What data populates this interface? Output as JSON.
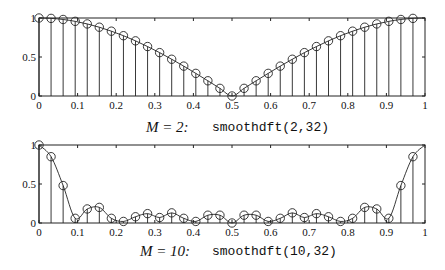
{
  "chart_data": [
    {
      "type": "stem",
      "title": "",
      "caption_math": "M = 2:",
      "caption_code": "smoothdft(2,32)",
      "xlabel": "",
      "ylabel": "",
      "xlim": [
        0,
        1
      ],
      "ylim": [
        0,
        1
      ],
      "xticks": [
        "0",
        "0.1",
        "0.2",
        "0.3",
        "0.4",
        "0.5",
        "0.6",
        "0.7",
        "0.8",
        "0.9",
        "1"
      ],
      "yticks": [
        "0",
        "0.5",
        "1"
      ],
      "grid": false,
      "legend": null,
      "x": [
        0,
        0.03125,
        0.0625,
        0.09375,
        0.125,
        0.15625,
        0.1875,
        0.21875,
        0.25,
        0.28125,
        0.3125,
        0.34375,
        0.375,
        0.40625,
        0.4375,
        0.46875,
        0.5,
        0.53125,
        0.5625,
        0.59375,
        0.625,
        0.65625,
        0.6875,
        0.71875,
        0.75,
        0.78125,
        0.8125,
        0.84375,
        0.875,
        0.90625,
        0.9375,
        0.96875
      ],
      "values": [
        1.0,
        0.995,
        0.981,
        0.957,
        0.924,
        0.882,
        0.831,
        0.773,
        0.707,
        0.634,
        0.556,
        0.471,
        0.383,
        0.29,
        0.195,
        0.098,
        0.0,
        0.098,
        0.195,
        0.29,
        0.383,
        0.471,
        0.556,
        0.634,
        0.707,
        0.773,
        0.831,
        0.882,
        0.924,
        0.957,
        0.981,
        0.995
      ],
      "curve_end": 1.0
    },
    {
      "type": "stem",
      "title": "",
      "caption_math": "M = 10:",
      "caption_code": "smoothdft(10,32)",
      "xlabel": "",
      "ylabel": "",
      "xlim": [
        0,
        1
      ],
      "ylim": [
        0,
        1
      ],
      "xticks": [
        "0",
        "0.1",
        "0.2",
        "0.3",
        "0.4",
        "0.5",
        "0.6",
        "0.7",
        "0.8",
        "0.9",
        "1"
      ],
      "yticks": [
        "0",
        "0.5",
        "1"
      ],
      "grid": false,
      "legend": null,
      "x": [
        0,
        0.03125,
        0.0625,
        0.09375,
        0.125,
        0.15625,
        0.1875,
        0.21875,
        0.25,
        0.28125,
        0.3125,
        0.34375,
        0.375,
        0.40625,
        0.4375,
        0.46875,
        0.5,
        0.53125,
        0.5625,
        0.59375,
        0.625,
        0.65625,
        0.6875,
        0.71875,
        0.75,
        0.78125,
        0.8125,
        0.84375,
        0.875,
        0.90625,
        0.9375,
        0.96875
      ],
      "values": [
        1.0,
        0.85,
        0.48,
        0.06,
        0.18,
        0.2,
        0.06,
        0.02,
        0.08,
        0.12,
        0.07,
        0.13,
        0.06,
        0.02,
        0.1,
        0.1,
        0.0,
        0.1,
        0.1,
        0.02,
        0.06,
        0.13,
        0.07,
        0.12,
        0.08,
        0.02,
        0.06,
        0.2,
        0.18,
        0.06,
        0.48,
        0.85
      ],
      "curve_end": 1.0
    }
  ],
  "plots": [
    {
      "caption_math": "M = 2:",
      "caption_code": "smoothdft(2,32)"
    },
    {
      "caption_math": "M = 10:",
      "caption_code": "smoothdft(10,32)"
    }
  ]
}
